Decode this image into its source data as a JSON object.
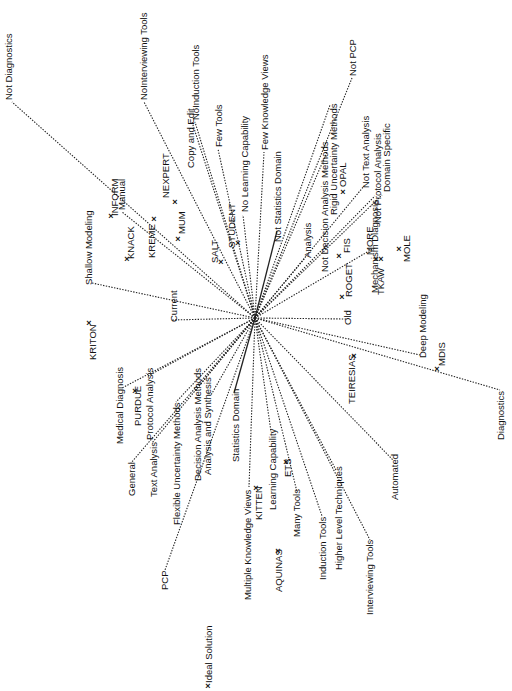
{
  "diagram": {
    "type": "biplot-star",
    "center": [
      255,
      318
    ],
    "construct_poles": [
      {
        "id": "not-diagnostics",
        "label": "Not Diagnostics",
        "end": [
          12,
          102
        ],
        "lx": 12,
        "ly": 100,
        "anchor": "start"
      },
      {
        "id": "shallow-modeling",
        "label": "Shallow Modeling",
        "end": [
          92,
          283
        ],
        "lx": 92,
        "ly": 285,
        "anchor": "start"
      },
      {
        "id": "current",
        "label": "Current",
        "end": [
          172,
          320
        ],
        "lx": 177,
        "ly": 322,
        "anchor": "middle"
      },
      {
        "id": "manual",
        "label": "Manual",
        "end": [
          122,
          212
        ],
        "lx": 125,
        "ly": 210,
        "anchor": "start"
      },
      {
        "id": "nointerviewing-tools",
        "label": "NoInterviewing Tools",
        "end": [
          144,
          102
        ],
        "lx": 147,
        "ly": 100,
        "anchor": "start"
      },
      {
        "id": "copy-and-edit",
        "label": "Copy and Edit",
        "end": [
          192,
          122
        ],
        "lx": 194,
        "ly": 168,
        "anchor": "start"
      },
      {
        "id": "noinduction-tools",
        "label": "NoInduction Tools",
        "end": [
          195,
          122
        ],
        "lx": 199,
        "ly": 120,
        "anchor": "start"
      },
      {
        "id": "few-tools",
        "label": "Few Tools",
        "end": [
          218,
          149
        ],
        "lx": 222,
        "ly": 147,
        "anchor": "start"
      },
      {
        "id": "no-learning-capability",
        "label": "No Learning Capability",
        "end": [
          243,
          215
        ],
        "lx": 248,
        "ly": 212,
        "anchor": "start"
      },
      {
        "id": "few-knowledge-views",
        "label": "Few Knowledge Views",
        "end": [
          264,
          152
        ],
        "lx": 268,
        "ly": 150,
        "anchor": "start"
      },
      {
        "id": "not-statistics-domain",
        "label": "Not Statistics Domain",
        "end": [
          277,
          231
        ],
        "lx": 281,
        "ly": 242,
        "anchor": "start"
      },
      {
        "id": "not-pcp",
        "label": "Not PCP",
        "end": [
          352,
          78
        ],
        "lx": 356,
        "ly": 76,
        "anchor": "start"
      },
      {
        "id": "analysis",
        "label": "Analysis",
        "end": [
          305,
          258
        ],
        "lx": 311,
        "ly": 258,
        "anchor": "start"
      },
      {
        "id": "not-decision-analysis-methods",
        "label": "Not Decision Analysis Methods",
        "end": [
          327,
          152
        ],
        "lx": 328,
        "ly": 272,
        "anchor": "start"
      },
      {
        "id": "rigid-uncertainty-methods",
        "label": "Rigid Uncertainty Methods",
        "end": [
          330,
          105
        ],
        "lx": 337,
        "ly": 215,
        "anchor": "start"
      },
      {
        "id": "not-text-analysis",
        "label": "Not Text Analysis",
        "end": [
          364,
          186
        ],
        "lx": 369,
        "ly": 188,
        "anchor": "start"
      },
      {
        "id": "not-protocol-analysis",
        "label": "Not Protocol Analysis",
        "end": [
          375,
          196
        ],
        "lx": 381,
        "ly": 223,
        "anchor": "start"
      },
      {
        "id": "domain-specific",
        "label": "Domain Specific",
        "end": [
          382,
          195
        ],
        "lx": 390,
        "ly": 192,
        "anchor": "start"
      },
      {
        "id": "mechanism-diagnosis",
        "label": "Mechanism Diagnosis",
        "end": [
          374,
          248
        ],
        "lx": 378,
        "ly": 293,
        "anchor": "start"
      },
      {
        "id": "old",
        "label": "Old",
        "end": [
          346,
          319
        ],
        "lx": 351,
        "ly": 325,
        "anchor": "start"
      },
      {
        "id": "deep-modeling",
        "label": "Deep Modeling",
        "end": [
          420,
          355
        ],
        "lx": 426,
        "ly": 358,
        "anchor": "start"
      },
      {
        "id": "diagnostics",
        "label": "Diagnostics",
        "end": [
          500,
          390
        ],
        "lx": 504,
        "ly": 440,
        "anchor": "start"
      },
      {
        "id": "automated",
        "label": "Automated",
        "end": [
          393,
          460
        ],
        "lx": 398,
        "ly": 500,
        "anchor": "start"
      },
      {
        "id": "interviewing-tools",
        "label": "Interviewing Tools",
        "end": [
          370,
          540
        ],
        "lx": 373,
        "ly": 615,
        "anchor": "start"
      },
      {
        "id": "higher-level-techniques",
        "label": "Higher Level Techniques",
        "end": [
          336,
          470
        ],
        "lx": 342,
        "ly": 570,
        "anchor": "start"
      },
      {
        "id": "induction-tools",
        "label": "Induction Tools",
        "end": [
          322,
          516
        ],
        "lx": 326,
        "ly": 580,
        "anchor": "start"
      },
      {
        "id": "many-tools",
        "label": "Many Tools",
        "end": [
          297,
          492
        ],
        "lx": 300,
        "ly": 537,
        "anchor": "start"
      },
      {
        "id": "learning-capability",
        "label": "Learning Capability",
        "end": [
          271,
          432
        ],
        "lx": 276,
        "ly": 510,
        "anchor": "start"
      },
      {
        "id": "multiple-knowledge-views",
        "label": "Multiple Knowledge Views",
        "end": [
          249,
          487
        ],
        "lx": 251,
        "ly": 600,
        "anchor": "start"
      },
      {
        "id": "statistics-domain",
        "label": "Statistics Domain",
        "end": [
          234,
          393
        ],
        "lx": 239,
        "ly": 462,
        "anchor": "start"
      },
      {
        "id": "analysis-and-synthesis",
        "label": "Analysis and Synthesis",
        "end": [
          211,
          395
        ],
        "lx": 211,
        "ly": 475,
        "anchor": "start"
      },
      {
        "id": "decision-analysis-methods",
        "label": "Decision Analysis Methods",
        "end": [
          195,
          391
        ],
        "lx": 201,
        "ly": 481,
        "anchor": "start"
      },
      {
        "id": "flexible-uncertainty-methods",
        "label": "Flexible Uncertainty Methods",
        "end": [
          176,
          402
        ],
        "lx": 180,
        "ly": 525,
        "anchor": "start"
      },
      {
        "id": "text-analysis",
        "label": "Text Analysis",
        "end": [
          152,
          443
        ],
        "lx": 157,
        "ly": 497,
        "anchor": "start"
      },
      {
        "id": "general",
        "label": "General",
        "end": [
          131,
          463
        ],
        "lx": 135,
        "ly": 496,
        "anchor": "start"
      },
      {
        "id": "protocol-analysis",
        "label": "Protocol Analysis",
        "end": [
          148,
          376
        ],
        "lx": 153,
        "ly": 440,
        "anchor": "start"
      },
      {
        "id": "medical-diagnosis",
        "label": "Medical Diagnosis",
        "end": [
          122,
          388
        ],
        "lx": 123,
        "ly": 444,
        "anchor": "start"
      },
      {
        "id": "pcp",
        "label": "PCP",
        "end": [
          165,
          570
        ],
        "lx": 168,
        "ly": 590,
        "anchor": "start"
      }
    ],
    "elements": [
      {
        "id": "inform",
        "label": "INFORM",
        "x": 111,
        "y": 216,
        "lx": 118,
        "ly": 216
      },
      {
        "id": "knack",
        "label": "KNACK",
        "x": 127,
        "y": 259,
        "lx": 134,
        "ly": 259
      },
      {
        "id": "kreme",
        "label": "KREME",
        "x": 154,
        "y": 219,
        "lx": 155,
        "ly": 258
      },
      {
        "id": "nexpert",
        "label": "NEXPERT",
        "x": 175,
        "y": 202,
        "lx": 169,
        "ly": 198
      },
      {
        "id": "mum",
        "label": "MUM",
        "x": 178,
        "y": 239,
        "lx": 185,
        "ly": 234
      },
      {
        "id": "salt",
        "label": "SALT",
        "x": 221,
        "y": 262,
        "lx": 218,
        "ly": 263
      },
      {
        "id": "student",
        "label": "STUDENT",
        "x": 238,
        "y": 243,
        "lx": 235,
        "ly": 248
      },
      {
        "id": "opal",
        "label": "OPAL",
        "x": 343,
        "y": 192,
        "lx": 346,
        "ly": 187
      },
      {
        "id": "fis",
        "label": "FIS",
        "x": 339,
        "y": 256,
        "lx": 350,
        "ly": 253
      },
      {
        "id": "more",
        "label": "MORE",
        "x": 376,
        "y": 259,
        "lx": 373,
        "ly": 255
      },
      {
        "id": "tkaw",
        "label": "TKAW",
        "x": 381,
        "y": 259,
        "lx": 384,
        "ly": 295
      },
      {
        "id": "mole",
        "label": "MOLE",
        "x": 399,
        "y": 249,
        "lx": 410,
        "ly": 262
      },
      {
        "id": "roget",
        "label": "ROGET",
        "x": 342,
        "y": 297,
        "lx": 352,
        "ly": 297
      },
      {
        "id": "teiresias",
        "label": "TEIRESIAS",
        "x": 354,
        "y": 356,
        "lx": 355,
        "ly": 404
      },
      {
        "id": "mdis",
        "label": "MDIS",
        "x": 437,
        "y": 369,
        "lx": 445,
        "ly": 366
      },
      {
        "id": "kriton",
        "label": "KRITON",
        "x": 89,
        "y": 323,
        "lx": 96,
        "ly": 360
      },
      {
        "id": "purdue",
        "label": "PURDUE",
        "x": 135,
        "y": 391,
        "lx": 141,
        "ly": 426
      },
      {
        "id": "kitten",
        "label": "KITTEN",
        "x": 256,
        "y": 488,
        "lx": 262,
        "ly": 520
      },
      {
        "id": "ets",
        "label": "ETS",
        "x": 286,
        "y": 462,
        "lx": 291,
        "ly": 477
      },
      {
        "id": "aquinas",
        "label": "AQUINAS",
        "x": 278,
        "y": 551,
        "lx": 282,
        "ly": 592
      },
      {
        "id": "ideal-solution",
        "label": "Ideal Solution",
        "x": 208,
        "y": 686,
        "lx": 212,
        "ly": 683
      }
    ],
    "solid_rays": [
      "not-statistics-domain",
      "statistics-domain"
    ]
  }
}
